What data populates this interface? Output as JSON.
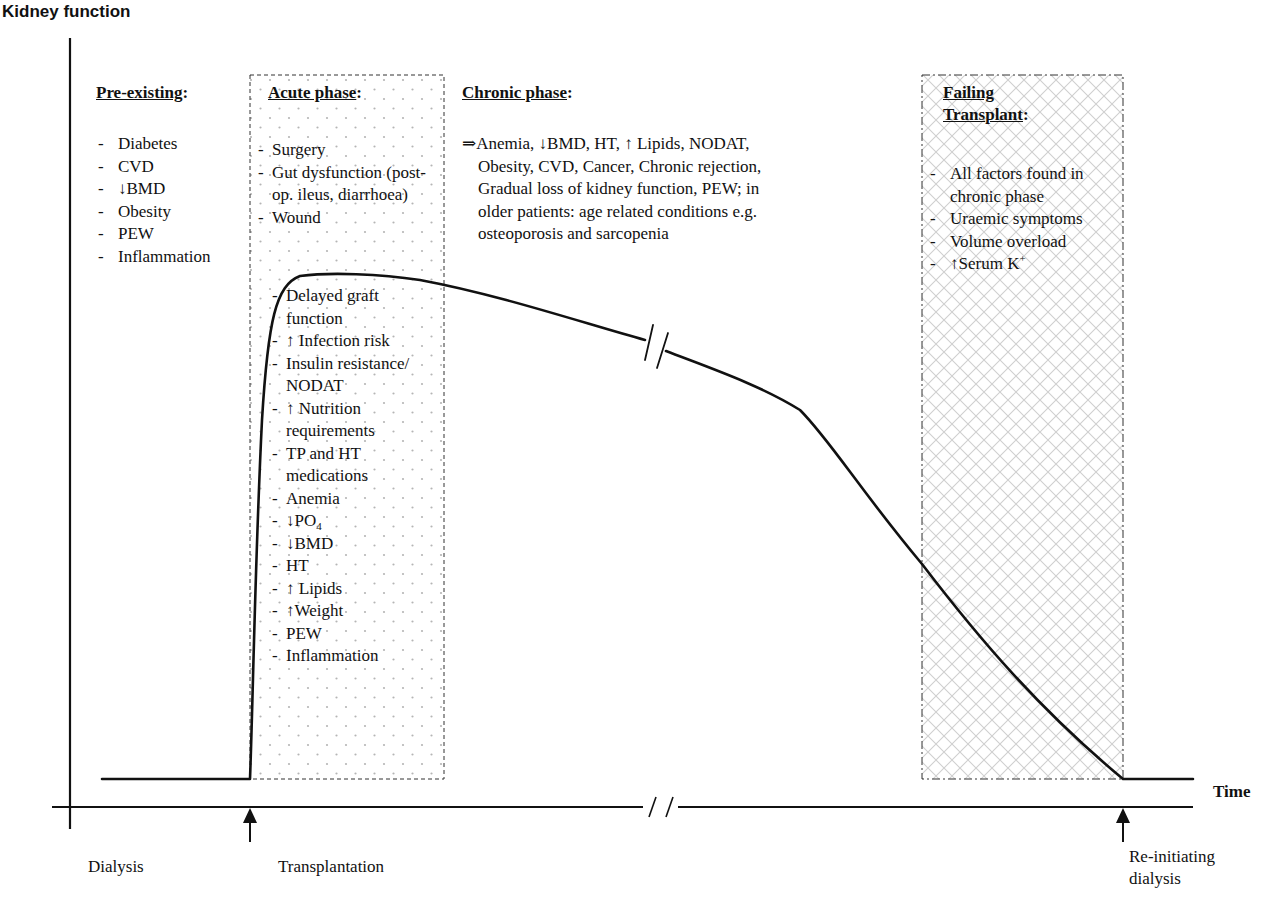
{
  "diagram": {
    "y_axis_label": "Kidney function",
    "x_axis_label": "Time",
    "x_markers": [
      {
        "label": "Dialysis"
      },
      {
        "label": "Transplantation"
      },
      {
        "label_line1": "Re-initiating",
        "label_line2": "dialysis"
      }
    ],
    "sections": {
      "pre_existing": {
        "heading": "Pre-existing",
        "colon": ":",
        "items": [
          "Diabetes",
          "CVD",
          "↓BMD",
          "Obesity",
          "PEW",
          "Inflammation"
        ]
      },
      "acute": {
        "heading": "Acute phase",
        "colon": ":",
        "items_top": [
          "Surgery",
          "Gut dysfunction (post-op. ileus, diarrhoea)",
          "Wound"
        ],
        "items_bottom": [
          "Delayed graft function",
          "↑ Infection risk",
          "Insulin resistance/ NODAT",
          "↑ Nutrition requirements",
          "TP and HT medications",
          "Anemia",
          "↓PO",
          "↓BMD",
          "HT",
          "↑ Lipids",
          "↑Weight",
          "PEW",
          "Inflammation"
        ],
        "po4_subscript": "4",
        "fill": "dotted"
      },
      "chronic": {
        "heading": "Chronic phase",
        "colon": ":",
        "lines": [
          "⇒Anemia, ↓BMD, HT, ↑ Lipids, NODAT,",
          "Obesity, CVD, Cancer, Chronic rejection,",
          "Gradual loss of kidney function, PEW; in",
          "older patients: age related conditions e.g.",
          "osteoporosis and sarcopenia"
        ]
      },
      "failing": {
        "heading_line1": "Failing",
        "heading_line2": "Transplant",
        "colon": ":",
        "items": [
          "All factors found in chronic phase",
          "Uraemic symptoms",
          "Volume overload",
          "↑Serum K"
        ],
        "k_superscript": "+",
        "fill": "crosshatch"
      }
    },
    "colors": {
      "line": "#111111",
      "box_border": "#333333",
      "dot_fill": "#b5b5b5",
      "hatch_fill": "#c8c8c8"
    }
  }
}
